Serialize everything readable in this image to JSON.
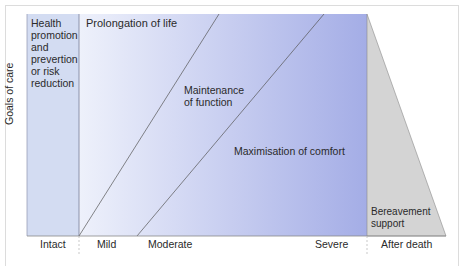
{
  "diagram": {
    "y_axis_label": "Goals of care",
    "regions": {
      "health_promotion": [
        "Health",
        "promotion",
        "and",
        "prevertion",
        "or risk",
        "reduction"
      ],
      "prolongation": "Prolongation of life",
      "maintenance": [
        "Maintenance",
        "of function"
      ],
      "maximisation": "Maximisation of comfort",
      "bereavement": [
        "Bereavement",
        "support"
      ]
    },
    "x_axis_labels": [
      "Intact",
      "Mild",
      "Moderate",
      "Severe",
      "After death"
    ],
    "colors": {
      "blue_light": "#e6ebf8",
      "blue_dark": "#a8b0e6",
      "left_band": "#cfd9f0",
      "grey": "#d3d3d3",
      "line": "#666666"
    }
  }
}
